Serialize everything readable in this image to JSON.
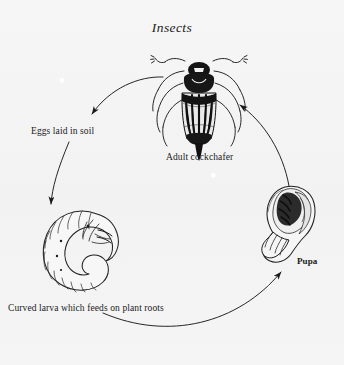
{
  "title": "Insects",
  "diagram": {
    "kind": "life-cycle",
    "direction": "counterclockwise",
    "background_color": "#f4f4f4",
    "ink_color": "#1a1a1a",
    "stages": [
      {
        "id": "adult",
        "label": "Adult cockchafer",
        "icon": "beetle-icon"
      },
      {
        "id": "eggs",
        "label": "Eggs laid in soil",
        "icon": "eggs-text-node"
      },
      {
        "id": "larva",
        "label": "Curved larva which feeds on plant roots",
        "icon": "grub-larva-icon"
      },
      {
        "id": "pupa",
        "label": "Pupa",
        "icon": "pupa-icon"
      }
    ],
    "arrows": [
      {
        "from": "adult",
        "to": "eggs"
      },
      {
        "from": "eggs",
        "to": "larva"
      },
      {
        "from": "larva",
        "to": "pupa"
      },
      {
        "from": "pupa",
        "to": "adult"
      }
    ]
  }
}
